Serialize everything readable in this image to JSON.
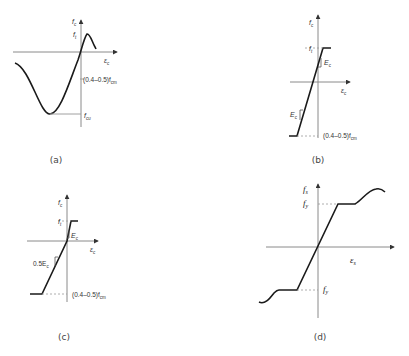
{
  "figure": {
    "panels": [
      {
        "id": "a",
        "caption": "(a)",
        "y_axis_label": "f",
        "y_axis_sub": "c",
        "x_axis_label": "ε",
        "x_axis_sub": "c",
        "peak_label": "f",
        "peak_sub": "t",
        "mid_label": "(0.4–0.5)f",
        "mid_sub": "cm",
        "min_label": "f",
        "min_sub": "cu",
        "description": "Nonlinear concrete stress-strain curve with tension peak and compression minimum"
      },
      {
        "id": "b",
        "caption": "(b)",
        "y_axis_label": "f",
        "y_axis_sub": "c",
        "x_axis_label": "ε",
        "x_axis_sub": "c",
        "top_label": "f",
        "top_sub": "t",
        "slope_top": "E",
        "slope_top_sub": "c",
        "slope_bottom": "E",
        "slope_bottom_sub": "c",
        "bottom_label": "(0.4–0.5)f",
        "bottom_sub": "cm",
        "description": "Bilinear elastic-perfectly-plastic concrete model"
      },
      {
        "id": "c",
        "caption": "(c)",
        "y_axis_label": "f",
        "y_axis_sub": "c",
        "x_axis_label": "ε",
        "x_axis_sub": "c",
        "top_label": "f",
        "top_sub": "t",
        "slope_top": "E",
        "slope_top_sub": "c",
        "slope_bottom": "0.5E",
        "slope_bottom_sub": "c",
        "bottom_label": "(0.4–0.5)f",
        "bottom_sub": "cm",
        "description": "Concrete model with reduced compression stiffness 0.5Ec"
      },
      {
        "id": "d",
        "caption": "(d)",
        "y_axis_label": "f",
        "y_axis_sub": "s",
        "x_axis_label": "ε",
        "x_axis_sub": "s",
        "top_label": "f",
        "top_sub": "y",
        "bottom_label": "f",
        "bottom_sub": "y",
        "description": "Steel stress-strain with yield plateau and strain hardening"
      }
    ]
  }
}
